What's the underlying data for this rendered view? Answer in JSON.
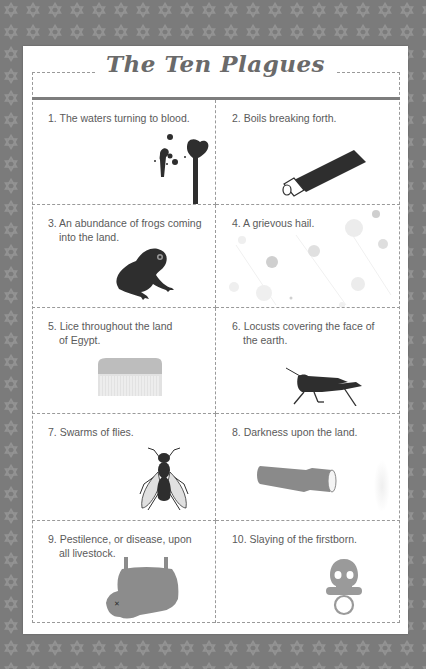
{
  "page": {
    "title": "The Ten Plagues",
    "colors": {
      "background": "#7b7b7b",
      "pattern_star": "#959595",
      "card": "#ffffff",
      "text": "#5a5a5a",
      "title": "#6a6a6a",
      "illustration_dark": "#2e2e2e",
      "illustration_mid": "#8c8c8c",
      "illustration_light": "#d6d6d6"
    },
    "background_pattern_icon": "star-of-david-icon"
  },
  "plagues": [
    {
      "number": "1.",
      "line1": "The waters turning to blood.",
      "line2": "",
      "icon": "blood-splatter-icon"
    },
    {
      "number": "2.",
      "line1": "Boils breaking forth.",
      "line2": "",
      "icon": "ointment-tube-icon"
    },
    {
      "number": "3.",
      "line1": "An abundance of frogs coming",
      "line2": "into the land.",
      "icon": "frog-icon"
    },
    {
      "number": "4.",
      "line1": "A grievous hail.",
      "line2": "",
      "icon": "hailstones-icon"
    },
    {
      "number": "5.",
      "line1": "Lice throughout the land",
      "line2": "of Egypt.",
      "icon": "lice-comb-icon"
    },
    {
      "number": "6.",
      "line1": "Locusts covering the face of",
      "line2": "the earth.",
      "icon": "locust-icon"
    },
    {
      "number": "7.",
      "line1": "Swarms of flies.",
      "line2": "",
      "icon": "fly-icon"
    },
    {
      "number": "8.",
      "line1": "Darkness upon the land.",
      "line2": "",
      "icon": "flashlight-icon"
    },
    {
      "number": "9.",
      "line1": "Pestilence, or disease, upon",
      "line2": "all livestock.",
      "icon": "cow-hide-icon"
    },
    {
      "number": "10.",
      "line1": "Slaying of the firstborn.",
      "line2": "",
      "icon": "skull-pacifier-icon"
    }
  ]
}
